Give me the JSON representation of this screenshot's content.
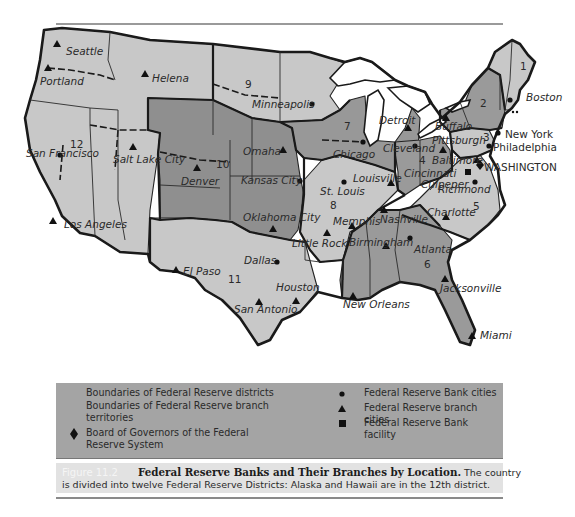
{
  "figure": {
    "number_label": "Figure 11.2",
    "title": "Federal Reserve Banks and Their Branches by Location.",
    "description_line1": "The country",
    "description_line2": "is divided into twelve Federal Reserve Districts: Alaska and Hawaii are in the 12th district."
  },
  "colors": {
    "district_dark": "#8f8f8f",
    "district_medium": "#a8a8a8",
    "district_light": "#c8c8c8",
    "water": "#ffffff",
    "legend_bg": "#a4a4a4",
    "caption_bg": "#e2e2e2"
  },
  "legend": {
    "left": [
      {
        "symbol": "none",
        "label_line1": "Boundaries of Federal Reserve districts",
        "label_line2": ""
      },
      {
        "symbol": "none",
        "label_line1": "Boundaries of Federal Reserve branch",
        "label_line2": "territories"
      },
      {
        "symbol": "diamond",
        "label_line1": "Board of Governors of the Federal",
        "label_line2": "Reserve System"
      }
    ],
    "right": [
      {
        "symbol": "circle",
        "label": "Federal Reserve Bank cities"
      },
      {
        "symbol": "triangle",
        "label": "Federal Reserve branch cities"
      },
      {
        "symbol": "square",
        "label": "Federal Reserve Bank facility"
      }
    ]
  },
  "map": {
    "districts": [
      {
        "number": "1",
        "x": 520,
        "y": 70
      },
      {
        "number": "2",
        "x": 480,
        "y": 105
      },
      {
        "number": "3",
        "x": 480,
        "y": 137
      },
      {
        "number": "4",
        "x": 419,
        "y": 162
      },
      {
        "number": "5",
        "x": 473,
        "y": 210
      },
      {
        "number": "6",
        "x": 424,
        "y": 268
      },
      {
        "number": "7",
        "x": 344,
        "y": 130
      },
      {
        "number": "8",
        "x": 330,
        "y": 209
      },
      {
        "number": "9",
        "x": 245,
        "y": 88
      },
      {
        "number": "10",
        "x": 216,
        "y": 168
      },
      {
        "number": "11",
        "x": 228,
        "y": 283
      },
      {
        "number": "12",
        "x": 70,
        "y": 148
      }
    ],
    "bank_cities": [
      {
        "name": "Boston",
        "x": 510,
        "y": 100,
        "lx": 526,
        "ly": 101
      },
      {
        "name": "New York",
        "x": 498,
        "y": 133,
        "lx": 505,
        "ly": 138
      },
      {
        "name": "Philadelphia",
        "x": 489,
        "y": 146,
        "lx": 493,
        "ly": 151
      },
      {
        "name": "Cleveland",
        "x": 415,
        "y": 146,
        "lx": 383,
        "ly": 152
      },
      {
        "name": "Richmond",
        "x": 475,
        "y": 182,
        "lx": 438,
        "ly": 193
      },
      {
        "name": "Atlanta",
        "x": 410,
        "y": 238,
        "lx": 414,
        "ly": 253
      },
      {
        "name": "Chicago",
        "x": 363,
        "y": 142,
        "lx": 333,
        "ly": 158
      },
      {
        "name": "St. Louis",
        "x": 344,
        "y": 182,
        "lx": 320,
        "ly": 195
      },
      {
        "name": "Minneapolis",
        "x": 312,
        "y": 104,
        "lx": 252,
        "ly": 108
      },
      {
        "name": "Kansas City",
        "x": 300,
        "y": 181,
        "lx": 241,
        "ly": 184
      },
      {
        "name": "Dallas",
        "x": 277,
        "y": 262,
        "lx": 244,
        "ly": 264
      },
      {
        "name": "San Francisco",
        "x": 60,
        "y": 155,
        "lx": 26,
        "ly": 157
      }
    ],
    "branch_cities": [
      {
        "name": "Seattle",
        "x": 57,
        "y": 44,
        "lx": 66,
        "ly": 55
      },
      {
        "name": "Portland",
        "x": 48,
        "y": 68,
        "lx": 40,
        "ly": 85
      },
      {
        "name": "Helena",
        "x": 145,
        "y": 74,
        "lx": 152,
        "ly": 82
      },
      {
        "name": "Salt Lake City",
        "x": 133,
        "y": 147,
        "lx": 113,
        "ly": 163
      },
      {
        "name": "Los Angeles",
        "x": 53,
        "y": 221,
        "lx": 64,
        "ly": 228
      },
      {
        "name": "Denver",
        "x": 197,
        "y": 168,
        "lx": 181,
        "ly": 185
      },
      {
        "name": "Omaha",
        "x": 283,
        "y": 150,
        "lx": 243,
        "ly": 155
      },
      {
        "name": "Oklahoma City",
        "x": 273,
        "y": 229,
        "lx": 243,
        "ly": 221
      },
      {
        "name": "El Paso",
        "x": 176,
        "y": 270,
        "lx": 183,
        "ly": 275
      },
      {
        "name": "San Antonio",
        "x": 259,
        "y": 302,
        "lx": 234,
        "ly": 313
      },
      {
        "name": "Houston",
        "x": 296,
        "y": 301,
        "lx": 276,
        "ly": 291
      },
      {
        "name": "Little Rock",
        "x": 327,
        "y": 233,
        "lx": 292,
        "ly": 247
      },
      {
        "name": "Memphis",
        "x": 352,
        "y": 226,
        "lx": 333,
        "ly": 225
      },
      {
        "name": "Louisville",
        "x": 391,
        "y": 183,
        "lx": 353,
        "ly": 182
      },
      {
        "name": "Nashville",
        "x": 384,
        "y": 210,
        "lx": 380,
        "ly": 223
      },
      {
        "name": "Birmingham",
        "x": 386,
        "y": 246,
        "lx": 349,
        "ly": 246
      },
      {
        "name": "New Orleans",
        "x": 353,
        "y": 296,
        "lx": 343,
        "ly": 308
      },
      {
        "name": "Jacksonville",
        "x": 445,
        "y": 279,
        "lx": 440,
        "ly": 292
      },
      {
        "name": "Miami",
        "x": 472,
        "y": 336,
        "lx": 480,
        "ly": 339
      },
      {
        "name": "Charlotte",
        "x": 446,
        "y": 217,
        "lx": 427,
        "ly": 216
      },
      {
        "name": "Baltimore",
        "x": 477,
        "y": 160,
        "lx": 432,
        "ly": 164
      },
      {
        "name": "Pittsburgh",
        "x": 443,
        "y": 150,
        "lx": 432,
        "ly": 144
      },
      {
        "name": "Buffalo",
        "x": 446,
        "y": 118,
        "lx": 435,
        "ly": 130
      },
      {
        "name": "Detroit",
        "x": 408,
        "y": 128,
        "lx": 379,
        "ly": 124
      },
      {
        "name": "Cincinnati",
        "x": 420,
        "y": 173,
        "lx": 404,
        "ly": 177
      }
    ],
    "facilities": [
      {
        "name": "Culpeper",
        "x": 468,
        "y": 172,
        "lx": 421,
        "ly": 188
      }
    ],
    "board_of_governors": {
      "name": "WASHINGTON",
      "x": 480,
      "y": 165,
      "lx": 480,
      "ly": 170
    }
  }
}
